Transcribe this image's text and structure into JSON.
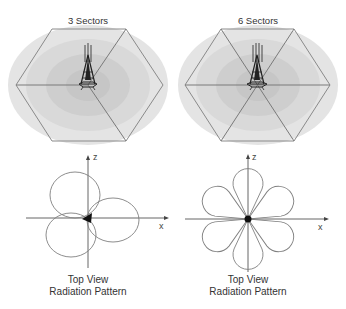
{
  "panels": [
    {
      "title": "3 Sectors",
      "sectors": 3,
      "pattern": {
        "axis_z_label": "z",
        "axis_x_label": "x",
        "caption_line1": "Top View",
        "caption_line2": "Radiation Pattern",
        "lobes": 3
      }
    },
    {
      "title": "6 Sectors",
      "sectors": 6,
      "pattern": {
        "axis_z_label": "z",
        "axis_x_label": "x",
        "caption_line1": "Top View",
        "caption_line2": "Radiation Pattern",
        "lobes": 6
      }
    }
  ],
  "colors": {
    "hex_line": "#888888",
    "coverage_outer": "#e2e2e2",
    "coverage_mid": "#d6d6d6",
    "coverage_inner": "#cbcbcb",
    "tower": "#222222",
    "pattern_line": "#777777",
    "axis": "#555555"
  }
}
